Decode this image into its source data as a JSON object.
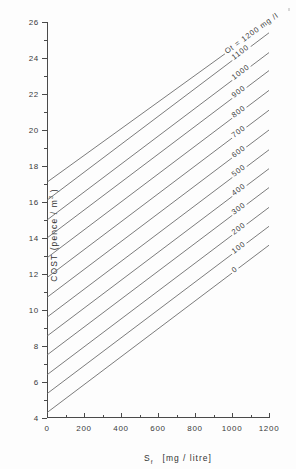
{
  "figure": {
    "background": "#fdfdfd",
    "line_color": "#6d6d6d",
    "axis_color": "#4a4a4a"
  },
  "axes": {
    "y_title": "COST  (pence / m",
    "y_title_sup": "3",
    "y_title_tail": " )",
    "x_title_symbol": "S",
    "x_title_sub": "f",
    "x_title_unit": "[mg / litre]",
    "y_ticks": [
      4,
      6,
      8,
      10,
      12,
      14,
      16,
      18,
      20,
      22,
      24,
      26
    ],
    "x_ticks": [
      0,
      200,
      400,
      600,
      800,
      1000,
      1200
    ],
    "y_tick_labels": [
      "4",
      "6",
      "8",
      "10",
      "12",
      "14",
      "16",
      "18",
      "20",
      "22",
      "24",
      "26"
    ],
    "x_tick_labels": [
      "0",
      "200",
      "400",
      "600",
      "800",
      "1000",
      "1200"
    ]
  },
  "annotations": {
    "top_label": "Ot = 1200  mg /l"
  },
  "chart_data": {
    "type": "line",
    "title": "",
    "xlabel": "Sf [mg/litre]",
    "ylabel": "COST (pence/m3)",
    "xlim": [
      0,
      1200
    ],
    "ylim": [
      4,
      26
    ],
    "grid": false,
    "legend_position": "inline-on-curves",
    "x": [
      0,
      1200
    ],
    "series": [
      {
        "name": "0",
        "label": "0",
        "values": [
          4.3,
          13.6
        ]
      },
      {
        "name": "100",
        "label": "100",
        "values": [
          5.35,
          14.65
        ]
      },
      {
        "name": "200",
        "label": "200",
        "values": [
          6.4,
          15.7
        ]
      },
      {
        "name": "300",
        "label": "300",
        "values": [
          7.5,
          16.8
        ]
      },
      {
        "name": "400",
        "label": "400",
        "values": [
          8.55,
          17.85
        ]
      },
      {
        "name": "500",
        "label": "500",
        "values": [
          9.6,
          18.9
        ]
      },
      {
        "name": "600",
        "label": "600",
        "values": [
          10.7,
          20.0
        ]
      },
      {
        "name": "700",
        "label": "700",
        "values": [
          11.8,
          21.1
        ]
      },
      {
        "name": "800",
        "label": "800",
        "values": [
          12.9,
          22.2
        ]
      },
      {
        "name": "900",
        "label": "900",
        "values": [
          14.0,
          23.3
        ]
      },
      {
        "name": "1000",
        "label": "1000",
        "values": [
          15.0,
          24.3
        ]
      },
      {
        "name": "1100",
        "label": "1100",
        "values": [
          16.1,
          25.4
        ]
      },
      {
        "name": "1200",
        "label": "Ot = 1200  mg /l",
        "values": [
          17.1,
          26.0
        ]
      }
    ]
  }
}
